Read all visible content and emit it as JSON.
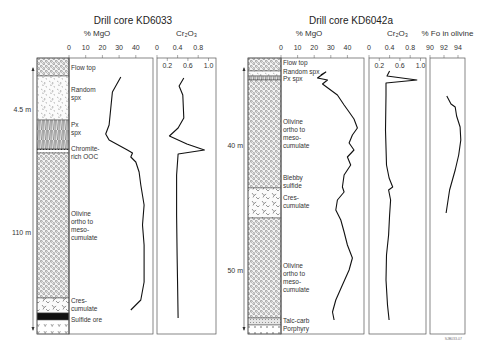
{
  "chart_data": [
    {
      "type": "line",
      "title": "Drill core KD6033",
      "depth_markers": [
        {
          "label": "4.5 m",
          "y": 112
        },
        {
          "label": "110 m",
          "y": 235
        }
      ],
      "lithology": [
        {
          "label": "Flow top",
          "pattern": "ooc",
          "y0": 58,
          "y1": 76
        },
        {
          "label": "Random spx",
          "pattern": "random",
          "y0": 76,
          "y1": 120
        },
        {
          "label": "Px spx",
          "pattern": "px",
          "y0": 120,
          "y1": 149
        },
        {
          "label": "Chromite-rich OOC",
          "pattern": "chromite",
          "y0": 149,
          "y1": 153
        },
        {
          "label": "Olivine ortho to meso-cumulate",
          "pattern": "ooc",
          "y0": 153,
          "y1": 298
        },
        {
          "label": "Cres-cumulate",
          "pattern": "cres",
          "y0": 298,
          "y1": 313
        },
        {
          "label": "Sulfide ore",
          "pattern": "sulfide",
          "y0": 313,
          "y1": 320
        },
        {
          "label": "",
          "pattern": "v",
          "y0": 320,
          "y1": 334
        }
      ],
      "lith_labels": [
        {
          "lines": [
            "Flow top"
          ],
          "y": 70
        },
        {
          "lines": [
            "Random",
            "spx"
          ],
          "y": 92
        },
        {
          "lines": [
            "Px",
            "spx"
          ],
          "y": 127
        },
        {
          "lines": [
            "Chromite-",
            "rich OOC"
          ],
          "y": 151
        },
        {
          "lines": [
            "Olivine",
            "ortho to",
            "meso-",
            "cumulate"
          ],
          "y": 216
        },
        {
          "lines": [
            "Cres-",
            "cumulate"
          ],
          "y": 303
        },
        {
          "lines": [
            "Sulfide ore"
          ],
          "y": 322
        }
      ],
      "series": [
        {
          "name": "% MgO",
          "xlabel": "% MgO",
          "ticks": [
            0,
            10,
            20,
            30,
            40
          ],
          "xlim": [
            0,
            50
          ],
          "points": [
            [
              31,
              77
            ],
            [
              26,
              92
            ],
            [
              25,
              108
            ],
            [
              24,
              125
            ],
            [
              22,
              134
            ],
            [
              24,
              140
            ],
            [
              35,
              150
            ],
            [
              38,
              153
            ],
            [
              37,
              157
            ],
            [
              40,
              162
            ],
            [
              42,
              172
            ],
            [
              43,
              185
            ],
            [
              45,
              205
            ],
            [
              44,
              225
            ],
            [
              45,
              245
            ],
            [
              45,
              265
            ],
            [
              45,
              282
            ],
            [
              43,
              300
            ],
            [
              37,
              310
            ]
          ]
        },
        {
          "name": "Cr2O3",
          "xlabel": "Cr₂O₃",
          "ticks_top": [
            0,
            0.4,
            0.8
          ],
          "ticks_inner": [
            0.2,
            0.6,
            1.0
          ],
          "xlim": [
            0,
            1.1
          ],
          "points": [
            [
              0.52,
              78
            ],
            [
              0.43,
              86
            ],
            [
              0.5,
              95
            ],
            [
              0.52,
              118
            ],
            [
              0.41,
              128
            ],
            [
              0.24,
              136
            ],
            [
              0.58,
              144
            ],
            [
              0.92,
              150
            ],
            [
              0.41,
              154
            ],
            [
              0.38,
              175
            ],
            [
              0.38,
              215
            ],
            [
              0.39,
              255
            ],
            [
              0.4,
              285
            ],
            [
              0.41,
              318
            ]
          ]
        }
      ]
    },
    {
      "type": "line",
      "title": "Drill core KD6042a",
      "depth_markers": [
        {
          "label": "40 m",
          "y": 148
        },
        {
          "label": "50 m",
          "y": 273
        }
      ],
      "lithology": [
        {
          "label": "Flow top",
          "pattern": "ooc",
          "y0": 58,
          "y1": 71
        },
        {
          "label": "Random spx",
          "pattern": "random",
          "y0": 71,
          "y1": 76
        },
        {
          "label": "Px spx",
          "pattern": "px",
          "y0": 76,
          "y1": 80
        },
        {
          "label": "Olivine ortho to meso-cumulate",
          "pattern": "ooc",
          "y0": 80,
          "y1": 188
        },
        {
          "label": "Cres-cumulate",
          "pattern": "cres",
          "y0": 188,
          "y1": 218
        },
        {
          "label": "Olivine ortho to meso-cumulate",
          "pattern": "ooc",
          "y0": 218,
          "y1": 318
        },
        {
          "label": "Talc-carb",
          "pattern": "talc",
          "y0": 318,
          "y1": 325
        },
        {
          "label": "Porphyry",
          "pattern": "plus",
          "y0": 325,
          "y1": 334
        }
      ],
      "lith_labels": [
        {
          "lines": [
            "Flow top"
          ],
          "y": 65
        },
        {
          "lines": [
            "Random spx"
          ],
          "y": 74
        },
        {
          "lines": [
            "Px spx"
          ],
          "y": 81
        },
        {
          "lines": [
            "Olivine",
            "ortho to",
            "meso-",
            "cumulate"
          ],
          "y": 124
        },
        {
          "lines": [
            "Blebby",
            "sulfide"
          ],
          "y": 180
        },
        {
          "lines": [
            "Cres-",
            "cumulate"
          ],
          "y": 200
        },
        {
          "lines": [
            "Olivine",
            "ortho to",
            "meso-",
            "cumulate"
          ],
          "y": 268
        },
        {
          "lines": [
            "Talc-carb"
          ],
          "y": 323
        },
        {
          "lines": [
            "Porphyry"
          ],
          "y": 331
        }
      ],
      "series": [
        {
          "name": "% MgO",
          "xlabel": "% MgO",
          "ticks": [
            0,
            10,
            20,
            30,
            40
          ],
          "xlim": [
            0,
            50
          ],
          "points": [
            [
              24,
              75
            ],
            [
              27,
              72
            ],
            [
              22,
              78
            ],
            [
              28,
              80
            ],
            [
              25,
              84
            ],
            [
              34,
              95
            ],
            [
              38,
              105
            ],
            [
              41,
              112
            ],
            [
              44,
              119
            ],
            [
              46,
              128
            ],
            [
              43,
              135
            ],
            [
              41,
              143
            ],
            [
              44,
              150
            ],
            [
              40,
              157
            ],
            [
              42,
              165
            ],
            [
              38,
              175
            ],
            [
              37,
              187
            ],
            [
              38,
              192
            ],
            [
              34,
              200
            ],
            [
              33,
              210
            ],
            [
              36,
              220
            ],
            [
              38,
              232
            ],
            [
              40,
              245
            ],
            [
              43,
              258
            ],
            [
              41,
              270
            ],
            [
              37,
              285
            ],
            [
              33,
              300
            ],
            [
              31,
              312
            ],
            [
              32,
              320
            ]
          ]
        },
        {
          "name": "Cr2O3",
          "xlabel": "Cr₂O₃",
          "ticks_top": [
            0,
            0.4,
            0.8
          ],
          "ticks_inner": [
            0.2,
            0.6,
            1.0
          ],
          "xlim": [
            0,
            1.1
          ],
          "points": [
            [
              0.4,
              71
            ],
            [
              0.35,
              76
            ],
            [
              0.93,
              80
            ],
            [
              0.33,
              83
            ],
            [
              0.33,
              95
            ],
            [
              0.32,
              130
            ],
            [
              0.34,
              165
            ],
            [
              0.39,
              178
            ],
            [
              0.46,
              187
            ],
            [
              0.38,
              190
            ],
            [
              0.42,
              200
            ],
            [
              0.4,
              215
            ],
            [
              0.38,
              235
            ],
            [
              0.34,
              255
            ],
            [
              0.33,
              280
            ],
            [
              0.36,
              305
            ],
            [
              0.39,
              320
            ]
          ]
        },
        {
          "name": "% Fo in olivine",
          "xlabel": "% Fo in olivine",
          "ticks": [
            90,
            92,
            94
          ],
          "xlim": [
            90,
            95
          ],
          "points": [
            [
              92.4,
              96
            ],
            [
              93.0,
              104
            ],
            [
              93.6,
              107
            ],
            [
              93.8,
              116
            ],
            [
              94.3,
              127
            ],
            [
              94.4,
              140
            ],
            [
              94.1,
              155
            ],
            [
              93.6,
              170
            ],
            [
              92.8,
              190
            ],
            [
              92.3,
              213
            ]
          ]
        }
      ]
    }
  ],
  "footnote": "SJB033-07"
}
